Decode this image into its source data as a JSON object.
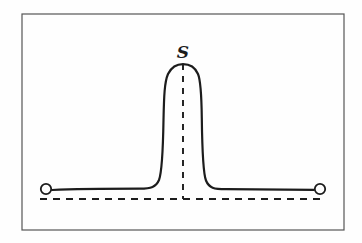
{
  "figure": {
    "kind": "hand-drawn-line-diagram",
    "background_color": "#fefefe",
    "ink_color": "#1c1c1c",
    "frame": {
      "name": "figure-border",
      "x": 22,
      "y": 14,
      "width": 322,
      "height": 216,
      "stroke_color": "#555555",
      "stroke_width": 1.2
    },
    "labels": {
      "peak_label": "S"
    },
    "markers": {
      "left_endpoint": {
        "cx": 46,
        "cy": 189,
        "r": 5.2
      },
      "right_endpoint": {
        "cx": 320,
        "cy": 189,
        "r": 5.2
      }
    },
    "baseline_dashed": {
      "name": "horizontal-reference-line",
      "x1": 40,
      "x2": 326,
      "y": 199,
      "dash": "7,6",
      "stroke_width": 1.9
    },
    "center_dashed": {
      "name": "peak-center-line",
      "x": 183,
      "y1": 64,
      "y2": 199,
      "dash": "6,6",
      "stroke_width": 1.9
    },
    "curve_path": "M 52 190 C 80 188.6, 110 188.6, 140 188.6 C 151 188.6, 156 187, 159 180 C 162 172, 163 150, 163.5 120 C 164 96, 164.5 82, 168 74 C 171.5 67.2, 176.5 64.2, 183 64.2 C 189.5 64.2, 195 67.2, 198 74 C 201 81, 201.5 95, 201.8 118 C 202.2 150, 203 173, 206 180.5 C 209 188, 214 189.2, 226 189.2 C 256 189.2, 286 189.6, 314 189.8",
    "curve_stroke_width": 2.2
  },
  "chart_data": {
    "type": "line",
    "title": "",
    "subtitle": "",
    "xlabel": "",
    "ylabel": "",
    "grid": false,
    "legend_position": "none",
    "annotations": [
      {
        "text": "S",
        "x": 183,
        "y": 52,
        "describes": "peak apex label"
      }
    ],
    "series": [
      {
        "name": "signal-trace",
        "description": "Flat baseline with a single tall narrow symmetric peak centered at x=183",
        "x": [
          52,
          90,
          120,
          140,
          152,
          158,
          161,
          163,
          164,
          168,
          175,
          183,
          191,
          198,
          202,
          203,
          205,
          209,
          216,
          240,
          280,
          314
        ],
        "y": [
          190,
          189,
          189,
          188.6,
          188.2,
          185,
          178,
          160,
          120,
          84,
          68,
          64,
          68,
          84,
          120,
          160,
          178,
          186,
          189,
          189,
          189.5,
          189.8
        ]
      }
    ],
    "reference_lines": [
      {
        "orientation": "horizontal",
        "value": 199,
        "style": "dashed",
        "from": 40,
        "to": 326
      },
      {
        "orientation": "vertical",
        "value": 183,
        "style": "dashed",
        "from": 64,
        "to": 199
      }
    ],
    "markers": [
      {
        "label": "O",
        "shape": "open-circle",
        "x": 46,
        "y": 189
      },
      {
        "label": "O",
        "shape": "open-circle",
        "x": 320,
        "y": 189
      }
    ],
    "xlim": [
      22,
      344
    ],
    "ylim": [
      230,
      14
    ]
  }
}
